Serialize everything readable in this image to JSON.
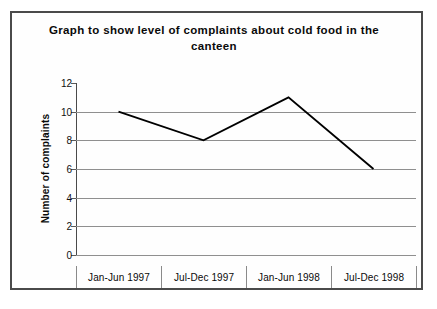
{
  "chart_data": {
    "type": "line",
    "title": "Graph to show level of complaints about cold food in the canteen",
    "xlabel": "",
    "ylabel": "Number of complaints",
    "categories": [
      "Jan-Jun 1997",
      "Jul-Dec 1997",
      "Jan-Jun 1998",
      "Jul-Dec 1998"
    ],
    "values": [
      10,
      8,
      11,
      6
    ],
    "ylim": [
      0,
      12
    ],
    "yticks": [
      0,
      2,
      4,
      6,
      8,
      10,
      12
    ],
    "ytick_labels": [
      "0",
      "2",
      "4",
      "6",
      "8",
      "10",
      "12"
    ],
    "grid": true,
    "legend": false,
    "series": [
      {
        "name": "Number of complaints",
        "values": [
          10,
          8,
          11,
          6
        ],
        "color": "#000000"
      }
    ]
  },
  "colors": {
    "line": "#000000",
    "gridline": "#8f8f8f",
    "axis": "#4a4a4a",
    "frame": "#4a4a4a",
    "text": "#0a0a0a",
    "background": "#ffffff"
  }
}
